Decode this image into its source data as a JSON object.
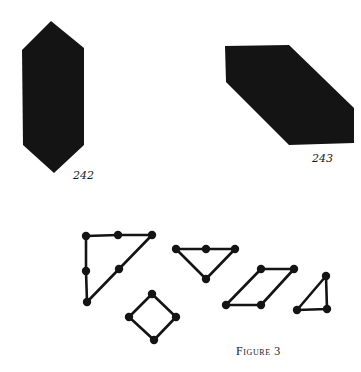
{
  "colors": {
    "background": "#ffffff",
    "ink": "#141414"
  },
  "figures": {
    "shape_242": {
      "label": "242",
      "points": [
        [
          51,
          21
        ],
        [
          84,
          48
        ],
        [
          84,
          145
        ],
        [
          54,
          173
        ],
        [
          23,
          145
        ],
        [
          22,
          50
        ]
      ],
      "label_pos": [
        73,
        170
      ]
    },
    "shape_243": {
      "label": "243",
      "points": [
        [
          225,
          46
        ],
        [
          289,
          45
        ],
        [
          354,
          108
        ],
        [
          354,
          143
        ],
        [
          289,
          145
        ],
        [
          226,
          82
        ]
      ],
      "label_pos": [
        312,
        153
      ]
    }
  },
  "graphs": [
    {
      "name": "right-triangle-graph",
      "nodes": [
        [
          86,
          236
        ],
        [
          118,
          235
        ],
        [
          152,
          235
        ],
        [
          119,
          269
        ],
        [
          87,
          302
        ],
        [
          86,
          271
        ]
      ],
      "closed": true
    },
    {
      "name": "diamond-graph",
      "nodes": [
        [
          152,
          294
        ],
        [
          176,
          317
        ],
        [
          154,
          340
        ],
        [
          129,
          317
        ]
      ],
      "closed": true
    },
    {
      "name": "inverted-triangle-graph",
      "nodes": [
        [
          176,
          249
        ],
        [
          206,
          249
        ],
        [
          235,
          249
        ],
        [
          206,
          279
        ]
      ],
      "closed": true
    },
    {
      "name": "parallelogram-graph",
      "nodes": [
        [
          261,
          269
        ],
        [
          294,
          269
        ],
        [
          261,
          305
        ],
        [
          226,
          305
        ]
      ],
      "closed": true
    },
    {
      "name": "small-triangle-graph",
      "nodes": [
        [
          326,
          276
        ],
        [
          327,
          309
        ],
        [
          297,
          310
        ]
      ],
      "closed": true
    }
  ],
  "caption": {
    "text": "Figure 3",
    "pos": [
      236,
      345
    ]
  }
}
